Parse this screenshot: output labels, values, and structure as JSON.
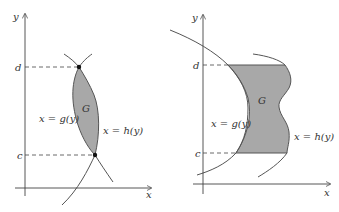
{
  "figures": [
    {
      "id": "left",
      "axes": {
        "x_label": "x",
        "y_label": "y"
      },
      "ticks": {
        "upper": "d",
        "lower": "c"
      },
      "region_label": "G",
      "left_curve_label": "x = g(y)",
      "right_curve_label": "x = h(y)",
      "colors": {
        "region_fill": "#a8a8a8",
        "curve": "#555555",
        "axis": "#444444"
      }
    },
    {
      "id": "right",
      "axes": {
        "x_label": "x",
        "y_label": "y"
      },
      "ticks": {
        "upper": "d",
        "lower": "c"
      },
      "region_label": "G",
      "left_curve_label": "x = g(y)",
      "right_curve_label": "x = h(y)",
      "colors": {
        "region_fill": "#a8a8a8",
        "curve": "#555555",
        "axis": "#444444"
      }
    }
  ]
}
